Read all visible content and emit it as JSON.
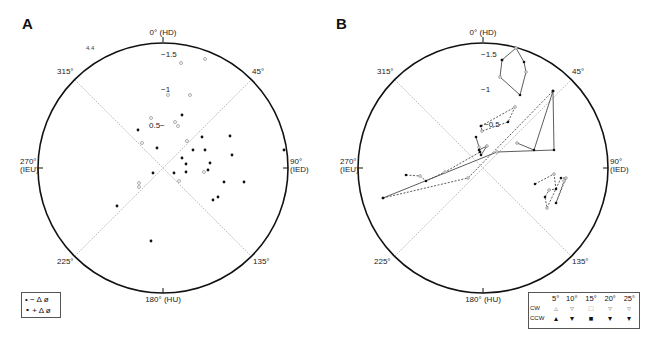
{
  "panels": {
    "A": {
      "label": "A"
    },
    "B": {
      "label": "B"
    }
  },
  "axis_labels": {
    "top": "0° (HD)",
    "bottom": "180° (HU)",
    "right_deg": "90°",
    "right_name": "(IED)",
    "left_deg": "270°",
    "left_name": "(IEU)",
    "d45": "45°",
    "d135": "135°",
    "d225": "225°",
    "d315": "315°"
  },
  "radial_labels": {
    "r15": "−1.5",
    "r1": "−1",
    "r05A": "0.5−",
    "r05B": "−0.5",
    "r44": "4.4"
  },
  "legend_A": {
    "row1": {
      "symbol": "•",
      "text": "− Δ ø"
    },
    "row2": {
      "symbol": "∘",
      "text": "+ Δ ø"
    }
  },
  "legend_B": {
    "headers": [
      "5°",
      "10°",
      "15°",
      "20°",
      "25°"
    ],
    "rows": [
      {
        "label": "CW",
        "symbols": [
          "▵",
          "▿",
          "□",
          "▿",
          "▿"
        ]
      },
      {
        "label": "CCW",
        "symbols": [
          "▴",
          "▾",
          "■",
          "▾",
          "▾"
        ]
      }
    ]
  },
  "chart_data": [
    {
      "type": "scatter",
      "title": "A",
      "coordinate_system": "polar (angle 0° = HD at top, clockwise; 90° = IED, 180° = HU, 270° = IEU)",
      "radial_ticks": [
        0.5,
        1,
        1.5,
        4.4
      ],
      "reference_lines": [
        "45°–225° diagonal",
        "135°–315° diagonal"
      ],
      "legend": [
        "• −Δø",
        "∘ +Δø"
      ],
      "series": [
        {
          "name": "−Δø (filled)",
          "points_px": [
            [
              182,
              115
            ],
            [
              138,
              130
            ],
            [
              157,
              148
            ],
            [
              202,
              137
            ],
            [
              230,
              136
            ],
            [
              193,
              150
            ],
            [
              205,
              150
            ],
            [
              232,
              155
            ],
            [
              182,
              158
            ],
            [
              186,
              164
            ],
            [
              284,
              150
            ],
            [
              210,
              163
            ],
            [
              174,
              173
            ],
            [
              208,
              170
            ],
            [
              186,
              172
            ],
            [
              224,
              182
            ],
            [
              244,
              182
            ],
            [
              213,
              200
            ],
            [
              218,
              197
            ],
            [
              153,
              173
            ],
            [
              117,
              206
            ],
            [
              151,
              241
            ]
          ]
        },
        {
          "name": "+Δø (open)",
          "points_px": [
            [
              181,
              63
            ],
            [
              205,
              59
            ],
            [
              168,
              95
            ],
            [
              190,
              95
            ],
            [
              151,
              118
            ],
            [
              175,
              122
            ],
            [
              178,
              126
            ],
            [
              187,
              141
            ],
            [
              142,
              143
            ],
            [
              204,
              172
            ],
            [
              179,
              181
            ],
            [
              139,
              183
            ],
            [
              139,
              187
            ]
          ]
        }
      ]
    },
    {
      "type": "line",
      "title": "B",
      "coordinate_system": "polar (same as A)",
      "radial_ticks": [
        0.5,
        1,
        1.5
      ],
      "legend": {
        "columns": [
          "5°",
          "10°",
          "15°",
          "20°",
          "25°"
        ],
        "rows": [
          "CW (open)",
          "CCW (filled)"
        ]
      },
      "series": [
        {
          "name": "loop-top",
          "style": "mixed",
          "points_px": [
            [
              502,
              60
            ],
            [
              516,
              48
            ],
            [
              524,
              62
            ],
            [
              526,
              72
            ],
            [
              520,
              95
            ],
            [
              500,
              77
            ],
            [
              502,
              60
            ]
          ]
        },
        {
          "name": "loop-0.5",
          "style": "mixed",
          "points_px": [
            [
              481,
              126
            ],
            [
              515,
              107
            ],
            [
              508,
              122
            ],
            [
              482,
              131
            ],
            [
              481,
              126
            ]
          ]
        },
        {
          "name": "cluster-center",
          "style": "mixed",
          "points_px": [
            [
              476,
              137
            ],
            [
              479,
              147
            ],
            [
              481,
              155
            ],
            [
              487,
              146
            ],
            [
              479,
              150
            ]
          ]
        },
        {
          "name": "diagonal-solid",
          "style": "solid",
          "points_px": [
            [
              383,
              198
            ],
            [
              497,
              152
            ],
            [
              554,
              150
            ],
            [
              553,
              91
            ],
            [
              534,
              150
            ],
            [
              517,
              143
            ]
          ]
        },
        {
          "name": "diagonal-dashed",
          "style": "dashed",
          "points_px": [
            [
              383,
              198
            ],
            [
              468,
              178
            ],
            [
              553,
              91
            ]
          ]
        },
        {
          "name": "zigzag-lower",
          "style": "mixed",
          "points_px": [
            [
              406,
              175
            ],
            [
              420,
              176
            ],
            [
              426,
              181
            ],
            [
              445,
              172
            ],
            [
              480,
              152
            ]
          ]
        },
        {
          "name": "right-lower",
          "style": "dashed",
          "points_px": [
            [
              535,
              184
            ],
            [
              554,
              174
            ],
            [
              556,
              189
            ],
            [
              549,
              190
            ],
            [
              545,
              197
            ],
            [
              547,
              208
            ],
            [
              561,
              178
            ],
            [
              566,
              178
            ],
            [
              556,
              203
            ],
            [
              564,
              181
            ]
          ]
        }
      ]
    }
  ]
}
